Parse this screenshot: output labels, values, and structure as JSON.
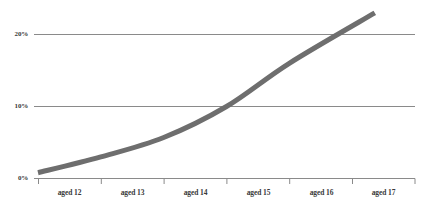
{
  "chart_data": {
    "type": "line",
    "title": "",
    "subtitle": "",
    "xlabel": "",
    "ylabel": "",
    "categories": [
      "aged 12",
      "aged 13",
      "aged 14",
      "aged 15",
      "aged 16",
      "aged 17"
    ],
    "values": [
      0.8,
      3.0,
      5.7,
      10.0,
      16.0,
      23.0
    ],
    "series": [
      {
        "name": "",
        "values": [
          0.8,
          3.0,
          5.7,
          10.0,
          16.0,
          23.0
        ],
        "color": "#6e6e6e"
      }
    ],
    "ylim": [
      0,
      24
    ],
    "ytick_values": [
      0,
      10,
      20
    ],
    "ytick_labels": [
      "0%",
      "10%",
      "20%"
    ],
    "xtick_labels": [
      "aged 12",
      "aged 13",
      "aged 14",
      "aged 15",
      "aged 16",
      "aged 17"
    ],
    "grid": true,
    "grid_axis": "y",
    "grid_color": "#808080",
    "axis_color": "#808080",
    "legend": false,
    "legend_position": "none",
    "background": "#ffffff",
    "line_color": "#6e6e6e",
    "line_width": 5,
    "annotations": []
  },
  "yaxis": {
    "ticks": [
      {
        "label": "20%",
        "value": 20
      },
      {
        "label": "10%",
        "value": 10
      },
      {
        "label": "0%",
        "value": 0
      }
    ]
  },
  "xaxis": {
    "ticks": [
      {
        "label": "aged 12"
      },
      {
        "label": "aged 13"
      },
      {
        "label": "aged 14"
      },
      {
        "label": "aged 15"
      },
      {
        "label": "aged 16"
      },
      {
        "label": "aged 17"
      }
    ]
  }
}
